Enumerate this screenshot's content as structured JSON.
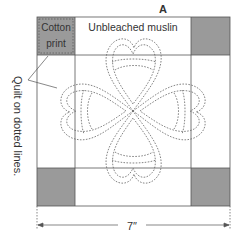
{
  "figure": {
    "label": "A",
    "labels": {
      "cotton_line1": "Cotton",
      "cotton_line2": "print",
      "muslin": "Unbleached muslin",
      "quilt_note": "Quilt on dotted lines.",
      "dimension": "7″"
    },
    "colors": {
      "print_fill": "#9a9a9a",
      "grid_line": "#555555",
      "stitch": "#666666",
      "text": "#333333"
    },
    "grid": {
      "outer": [
        37,
        17,
        230,
        206
      ],
      "inner_x": [
        75,
        191
      ],
      "inner_y": [
        55,
        168
      ]
    }
  }
}
